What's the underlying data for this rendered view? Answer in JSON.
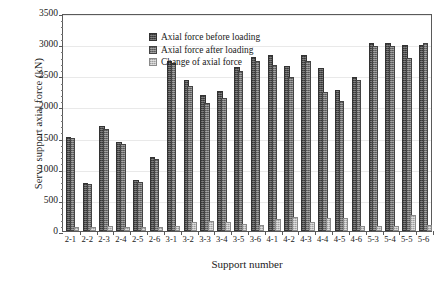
{
  "chart_data": {
    "type": "bar",
    "title": "",
    "xlabel": "Support number",
    "ylabel": "Servo support axial force (kN)",
    "ylim": [
      0,
      3500
    ],
    "ytick_step": 500,
    "yticks": [
      "3500",
      "3000",
      "2500",
      "2000",
      "1500",
      "1000",
      "500",
      "0"
    ],
    "grid": true,
    "legend_position": "top-left-inside",
    "categories": [
      "2-1",
      "2-2",
      "2-3",
      "2-4",
      "2-5",
      "2-6",
      "3-1",
      "3-2",
      "3-3",
      "3-4",
      "3-5",
      "3-6",
      "4-1",
      "4-2",
      "4-3",
      "4-4",
      "4-5",
      "4-6",
      "5-3",
      "5-4",
      "5-5",
      "5-6"
    ],
    "series": [
      {
        "name": "Axial force before loading",
        "color": "#4a4a4a",
        "values": [
          1480,
          740,
          1650,
          1390,
          780,
          1150,
          2700,
          2400,
          2150,
          2220,
          2600,
          2760,
          2800,
          2620,
          2800,
          2580,
          2230,
          2440,
          2980,
          2980,
          2960,
          2960
        ]
      },
      {
        "name": "Axial force after loading",
        "color": "#6e6e6e",
        "values": [
          1460,
          720,
          1610,
          1360,
          760,
          1130,
          2660,
          2300,
          2020,
          2100,
          2530,
          2700,
          2640,
          2440,
          2700,
          2200,
          2060,
          2400,
          2940,
          2940,
          2740,
          2980
        ]
      },
      {
        "name": "Change of axial force",
        "color": "#bdbdbd",
        "values": [
          30,
          25,
          45,
          40,
          25,
          30,
          50,
          105,
          130,
          120,
          75,
          60,
          165,
          185,
          105,
          180,
          170,
          45,
          55,
          50,
          225,
          60
        ]
      }
    ]
  },
  "legend": {
    "items": [
      {
        "label": "Axial force before loading",
        "color": "#4a4a4a"
      },
      {
        "label": "Axial force after loading",
        "color": "#6e6e6e"
      },
      {
        "label": "Change of axial force",
        "color": "#bdbdbd"
      }
    ]
  }
}
